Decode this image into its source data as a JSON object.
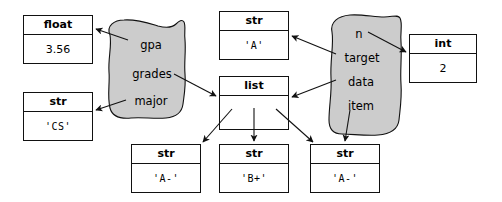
{
  "diagram": {
    "background_color": "#ffffff",
    "blob_fill_color": "#cccccc",
    "blob_stroke_color": "#111111",
    "box_stroke_color": "#111111",
    "text_color": "#000000"
  },
  "objects": {
    "float_gpa": {
      "type": "float",
      "value": "3.56"
    },
    "str_major": {
      "type": "str",
      "value": "'CS'"
    },
    "str_a": {
      "type": "str",
      "value": "'A'"
    },
    "list_grades": {
      "type": "list",
      "value": ""
    },
    "int_two": {
      "type": "int",
      "value": "2"
    },
    "str_item0": {
      "type": "str",
      "value": "'A-'"
    },
    "str_item1": {
      "type": "str",
      "value": "'B+'"
    },
    "str_item2": {
      "type": "str",
      "value": "'A-'"
    }
  },
  "blobs": [
    {
      "id": "student-object",
      "fields": [
        "gpa",
        "grades",
        "major"
      ]
    },
    {
      "id": "search-frame-object",
      "fields": [
        "n",
        "target",
        "data",
        "item"
      ]
    }
  ],
  "references": [
    {
      "from": "gpa",
      "to": "float_gpa"
    },
    {
      "from": "grades",
      "to": "list_grades"
    },
    {
      "from": "major",
      "to": "str_major"
    },
    {
      "from": "n",
      "to": "int_two"
    },
    {
      "from": "target",
      "to": "str_a"
    },
    {
      "from": "data",
      "to": "list_grades"
    },
    {
      "from": "item",
      "to": "str_item2"
    },
    {
      "from": "list_grades",
      "to": "str_item0"
    },
    {
      "from": "list_grades",
      "to": "str_item1"
    },
    {
      "from": "list_grades",
      "to": "str_item2"
    }
  ]
}
